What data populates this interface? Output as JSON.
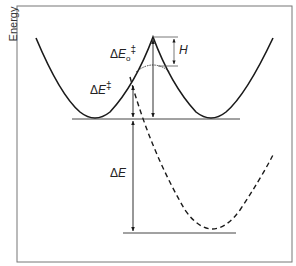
{
  "diagram": {
    "type": "potential-energy-curve",
    "axis": {
      "ylabel": "Energy"
    },
    "labels": {
      "delta_e0_ddagger": {
        "prefix": "Δ",
        "var": "E",
        "sub": "o",
        "sup": "‡"
      },
      "delta_e_ddagger": {
        "prefix": "Δ",
        "var": "E",
        "sup": "‡"
      },
      "h": {
        "var": "H"
      },
      "delta_e": {
        "prefix": "Δ",
        "var": "E"
      }
    },
    "curves": [
      {
        "name": "diabatic-double-well",
        "style": "solid"
      },
      {
        "name": "adiabatic-top",
        "style": "thin"
      },
      {
        "name": "excited-state-parabola",
        "style": "dashed"
      }
    ],
    "colors": {
      "line": "#1a1a1a",
      "frame": "#555555",
      "baseline": "#444444"
    }
  }
}
